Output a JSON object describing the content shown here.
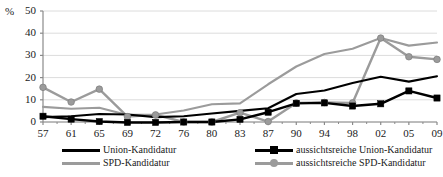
{
  "chart_data": {
    "type": "line",
    "title": "",
    "subtitle": "",
    "xlabel": "",
    "ylabel": "%",
    "unit_label": "%",
    "categories": [
      "57",
      "61",
      "65",
      "69",
      "72",
      "76",
      "80",
      "83",
      "87",
      "90",
      "94",
      "98",
      "02",
      "05",
      "09"
    ],
    "xlim": [
      "57",
      "09"
    ],
    "ylim": [
      0,
      50
    ],
    "yticks": [
      0,
      10,
      20,
      30,
      40,
      50
    ],
    "grid": true,
    "grid_axis": "y",
    "legend_position": "bottom",
    "series": [
      {
        "name": "Union-Kandidatur",
        "color": "#000000",
        "marker": "none",
        "values": [
          2.2,
          2.6,
          3.6,
          3.4,
          2.2,
          2.6,
          3.8,
          5.0,
          6.2,
          12.6,
          14.2,
          17.6,
          20.4,
          18.2,
          20.6
        ]
      },
      {
        "name": "aussichtsreiche Union-Kandidatur",
        "color": "#000000",
        "marker": "square",
        "values": [
          2.6,
          1.3,
          0.2,
          -0.2,
          -0.2,
          0.0,
          0.0,
          1.2,
          4.4,
          8.4,
          8.6,
          7.2,
          8.2,
          14.0,
          10.8
        ]
      },
      {
        "name": "SPD-Kandidatur",
        "color": "#9b9b9b",
        "marker": "none",
        "values": [
          6.8,
          6.0,
          6.4,
          3.2,
          3.4,
          5.2,
          8.0,
          8.4,
          17.0,
          25.0,
          30.6,
          33.0,
          37.8,
          34.4,
          35.8
        ]
      },
      {
        "name": "aussichtsreiche SPD-Kandidatur",
        "color": "#9b9b9b",
        "marker": "circle",
        "values": [
          15.6,
          9.0,
          14.8,
          2.4,
          3.2,
          0.0,
          0.0,
          4.2,
          0.2,
          8.6,
          8.8,
          8.6,
          37.8,
          29.4,
          28.2
        ]
      }
    ]
  },
  "legend": {
    "items": [
      {
        "label": "Union-Kandidatur"
      },
      {
        "label": "aussichtsreiche Union-Kandidatur"
      },
      {
        "label": "SPD-Kandidatur"
      },
      {
        "label": "aussichtsreiche SPD-Kandidatur"
      }
    ]
  },
  "colors": {
    "union": "#000000",
    "spd": "#9b9b9b",
    "grid": "#dcdcdc",
    "axis": "#8a8a8a",
    "text": "#1a1a1a",
    "background": "#ffffff"
  }
}
